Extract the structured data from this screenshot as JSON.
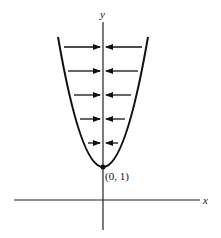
{
  "figure": {
    "type": "phase-diagram",
    "axes": {
      "x_label": "x",
      "y_label": "y"
    },
    "curve": {
      "shape": "parabola opening upward",
      "vertex_label": "(0, 1)"
    },
    "arrow_rows": 5,
    "arrow_direction": "toward y-axis from both sides"
  }
}
